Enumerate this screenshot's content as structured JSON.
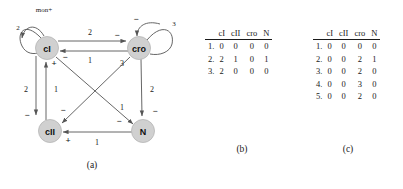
{
  "figure": {
    "captions": {
      "a": "(a)",
      "b": "(b)",
      "c": "(c)"
    }
  },
  "graph": {
    "nodes": [
      {
        "id": "cI",
        "label": "cI",
        "cx": 47,
        "cy": 48
      },
      {
        "id": "cro",
        "label": "cro",
        "cx": 139,
        "cy": 48
      },
      {
        "id": "cII",
        "label": "cII",
        "cx": 50,
        "cy": 131
      },
      {
        "id": "N",
        "label": "N",
        "cx": 143,
        "cy": 131
      }
    ],
    "self_loops": [
      {
        "node": "cI",
        "weight": "2",
        "sign": "mon+"
      },
      {
        "node": "cro",
        "weight": "3",
        "sign": "−"
      }
    ],
    "edges": [
      {
        "from": "cI",
        "to": "cro",
        "weight": "2",
        "sign": "−"
      },
      {
        "from": "cro",
        "to": "cI",
        "weight": "1",
        "sign": "−"
      },
      {
        "from": "cI",
        "to": "cII",
        "weight": "2",
        "sign": "−"
      },
      {
        "from": "cII",
        "to": "cI",
        "weight": "1",
        "sign": "+"
      },
      {
        "from": "cro",
        "to": "N",
        "weight": "2",
        "sign": "−"
      },
      {
        "from": "N",
        "to": "cII",
        "weight": "1",
        "sign": "+"
      },
      {
        "from": "cro",
        "to": "cII",
        "weight": "3",
        "sign": "−"
      },
      {
        "from": "cI",
        "to": "N",
        "weight": "1",
        "sign": "−"
      }
    ],
    "colors": {
      "node_fill": "#d0d0d0",
      "node_stroke": "#b5b5b5",
      "edge": "#555555",
      "text": "#111111"
    }
  },
  "table_b": {
    "headers": [
      "",
      "cI",
      "cII",
      "cro",
      "N"
    ],
    "rows": [
      {
        "index": "1.",
        "cells": [
          "0",
          "0",
          "0",
          "0"
        ]
      },
      {
        "index": "2.",
        "cells": [
          "2",
          "1",
          "0",
          "1"
        ]
      },
      {
        "index": "3.",
        "cells": [
          "2",
          "0",
          "0",
          "0"
        ]
      }
    ]
  },
  "table_c": {
    "headers": [
      "",
      "cI",
      "cII",
      "cro",
      "N"
    ],
    "rows": [
      {
        "index": "1.",
        "cells": [
          "0",
          "0",
          "0",
          "0"
        ]
      },
      {
        "index": "2.",
        "cells": [
          "0",
          "0",
          "2",
          "1"
        ]
      },
      {
        "index": "3.",
        "cells": [
          "0",
          "0",
          "2",
          "0"
        ]
      },
      {
        "index": "4.",
        "cells": [
          "0",
          "0",
          "3",
          "0"
        ]
      },
      {
        "index": "5.",
        "cells": [
          "0",
          "0",
          "2",
          "0"
        ]
      }
    ]
  }
}
